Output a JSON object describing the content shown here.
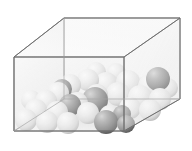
{
  "figure": {
    "name": "particles-in-transparent-box",
    "description": "Isometric view of an open transparent rectangular container holding a pile of packed spheres; most spheres are light gray/white, several are dark gray.",
    "background_color": "#ffffff"
  },
  "container": {
    "name": "transparent-box",
    "edge_color": "#6e6e6e",
    "edge_color_light": "#a8a8a8",
    "face_fill_front": "#f2f2f2",
    "face_fill_side": "#ededed",
    "face_fill_top": "#fafafa",
    "face_fill_back": "#f6f6f6",
    "opacity": "0.55",
    "vertices": {
      "front_bottom_left": [
        14,
        131
      ],
      "front_bottom_right": [
        124,
        131
      ],
      "front_top_left": [
        14,
        57
      ],
      "front_top_right": [
        124,
        57
      ],
      "back_bottom_left": [
        64,
        99
      ],
      "back_bottom_right": [
        180,
        99
      ],
      "back_top_left": [
        64,
        18
      ],
      "back_top_right": [
        180,
        18
      ]
    }
  },
  "palette": {
    "sphere_light_highlight": "#ffffff",
    "sphere_light_mid": "#e8e8e8",
    "sphere_light_shadow": "#b9b9b9",
    "sphere_dark_highlight": "#c9c9c9",
    "sphere_dark_mid": "#8d8d8d",
    "sphere_dark_shadow": "#5a5a5a",
    "floor_shadow": "#d8d8d8"
  },
  "legend": {
    "light_sphere_label": "light sphere",
    "dark_sphere_label": "dark sphere"
  },
  "counts": {
    "light_spheres": 26,
    "dark_spheres": 7,
    "total_spheres": 33
  },
  "spheres": [
    {
      "id": "s01",
      "cx": 106,
      "cy": 84,
      "r": 12,
      "shade": "light"
    },
    {
      "id": "s02",
      "cx": 128,
      "cy": 82,
      "r": 12,
      "shade": "light"
    },
    {
      "id": "s03",
      "cx": 150,
      "cy": 86,
      "r": 12,
      "shade": "light"
    },
    {
      "id": "s04",
      "cx": 88,
      "cy": 80,
      "r": 11,
      "shade": "light"
    },
    {
      "id": "s05",
      "cx": 70,
      "cy": 85,
      "r": 11,
      "shade": "light"
    },
    {
      "id": "s06",
      "cx": 118,
      "cy": 94,
      "r": 12,
      "shade": "light"
    },
    {
      "id": "s07",
      "cx": 140,
      "cy": 97,
      "r": 12,
      "shade": "light"
    },
    {
      "id": "s08",
      "cx": 160,
      "cy": 99,
      "r": 11,
      "shade": "light"
    },
    {
      "id": "s09",
      "cx": 58,
      "cy": 93,
      "r": 11,
      "shade": "light"
    },
    {
      "id": "s10",
      "cx": 97,
      "cy": 95,
      "r": 11,
      "shade": "light"
    },
    {
      "id": "s11",
      "cx": 46,
      "cy": 101,
      "r": 11,
      "shade": "light"
    },
    {
      "id": "s12",
      "cx": 77,
      "cy": 103,
      "r": 11,
      "shade": "light"
    },
    {
      "id": "s13",
      "cx": 130,
      "cy": 108,
      "r": 11,
      "shade": "light"
    },
    {
      "id": "s14",
      "cx": 150,
      "cy": 110,
      "r": 11,
      "shade": "light"
    },
    {
      "id": "s15",
      "cx": 36,
      "cy": 110,
      "r": 11,
      "shade": "light"
    },
    {
      "id": "s16",
      "cx": 57,
      "cy": 112,
      "r": 11,
      "shade": "light"
    },
    {
      "id": "s17",
      "cx": 88,
      "cy": 113,
      "r": 11,
      "shade": "light"
    },
    {
      "id": "s18",
      "cx": 110,
      "cy": 116,
      "r": 11,
      "shade": "light"
    },
    {
      "id": "s19",
      "cx": 26,
      "cy": 120,
      "r": 11,
      "shade": "light"
    },
    {
      "id": "s20",
      "cx": 47,
      "cy": 122,
      "r": 11,
      "shade": "light"
    },
    {
      "id": "s21",
      "cx": 68,
      "cy": 123,
      "r": 11,
      "shade": "light"
    },
    {
      "id": "s22",
      "cx": 31,
      "cy": 100,
      "r": 10,
      "shade": "light"
    },
    {
      "id": "s23",
      "cx": 168,
      "cy": 88,
      "r": 10,
      "shade": "light"
    },
    {
      "id": "s24",
      "cx": 96,
      "cy": 72,
      "r": 10,
      "shade": "light"
    },
    {
      "id": "s25",
      "cx": 116,
      "cy": 73,
      "r": 10,
      "shade": "light"
    },
    {
      "id": "s26",
      "cx": 138,
      "cy": 87,
      "r": 10,
      "shade": "light"
    },
    {
      "id": "d01",
      "cx": 62,
      "cy": 89,
      "r": 10,
      "shade": "dark"
    },
    {
      "id": "d02",
      "cx": 70,
      "cy": 105,
      "r": 11,
      "shade": "dark"
    },
    {
      "id": "d03",
      "cx": 95,
      "cy": 100,
      "r": 13,
      "shade": "dark"
    },
    {
      "id": "d04",
      "cx": 106,
      "cy": 122,
      "r": 12,
      "shade": "dark"
    },
    {
      "id": "d05",
      "cx": 122,
      "cy": 114,
      "r": 9,
      "shade": "dark"
    },
    {
      "id": "d06",
      "cx": 126,
      "cy": 124,
      "r": 9,
      "shade": "dark"
    },
    {
      "id": "d07",
      "cx": 158,
      "cy": 79,
      "r": 12,
      "shade": "dark"
    }
  ]
}
